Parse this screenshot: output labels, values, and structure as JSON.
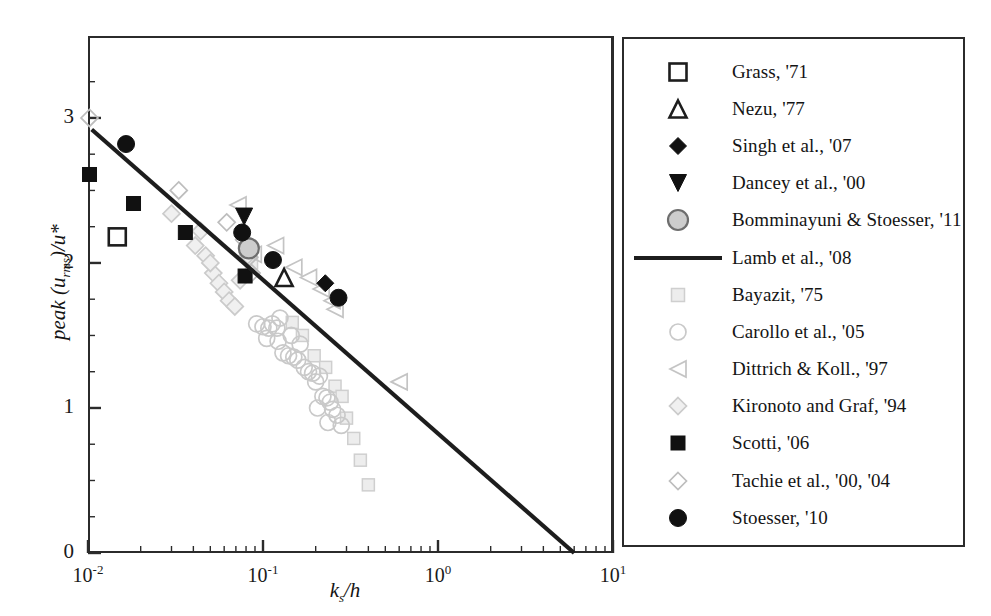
{
  "chart_data": {
    "type": "scatter",
    "title": "",
    "xlabel": "k_s/h",
    "xlabel_main": "k",
    "xlabel_sub": "s",
    "xlabel_tail": "/h",
    "ylabel": "peak (u_rms)/u*",
    "ylabel_pre": "peak (u",
    "ylabel_sub": "rms",
    "ylabel_post": ")/u*",
    "xscale": "log",
    "yscale": "linear",
    "xlim": [
      0.01,
      10
    ],
    "ylim": [
      0,
      3.4
    ],
    "grid": false,
    "legend_position": "right-outside",
    "xticks": [
      {
        "value": 0.01,
        "label_base": "10",
        "label_exp": "-2"
      },
      {
        "value": 0.1,
        "label_base": "10",
        "label_exp": "-1"
      },
      {
        "value": 1,
        "label_base": "10",
        "label_exp": "0"
      },
      {
        "value": 10,
        "label_base": "10",
        "label_exp": "1"
      }
    ],
    "yticks": [
      {
        "value": 0,
        "label": "0"
      },
      {
        "value": 1,
        "label": "1"
      },
      {
        "value": 2,
        "label": "2"
      },
      {
        "value": 3,
        "label": "3"
      }
    ],
    "fit_line": {
      "name": "Lamb et al., '08",
      "x_start": 0.0105,
      "y_start": 2.92,
      "x_end": 6.0,
      "y_end": 0.0,
      "color": "#1d1d1d",
      "width": 4.2
    },
    "series": [
      {
        "name": "Grass, '71",
        "marker": "square-open",
        "color": "#1d1d1d",
        "size": 17,
        "points": [
          [
            0.0147,
            2.18
          ]
        ]
      },
      {
        "name": "Nezu, '77",
        "marker": "triangle-up-open",
        "color": "#1d1d1d",
        "size": 17,
        "points": [
          [
            0.132,
            1.9
          ]
        ]
      },
      {
        "name": "Singh et al., '07",
        "marker": "diamond-filled",
        "color": "#111111",
        "size": 17,
        "points": [
          [
            0.227,
            1.86
          ]
        ]
      },
      {
        "name": "Dancey et al., '00",
        "marker": "triangle-down-filled",
        "color": "#111111",
        "size": 17,
        "points": [
          [
            0.078,
            2.32
          ]
        ]
      },
      {
        "name": "Bomminayuni & Stoesser, '11",
        "marker": "circle-grey",
        "color": "#9c9c9c",
        "size": 20,
        "points": [
          [
            0.083,
            2.1
          ]
        ]
      },
      {
        "name": "Bayazit, '75",
        "marker": "square-light",
        "color": "#cfcfcf",
        "size": 12,
        "points": [
          [
            0.086,
            2.0
          ],
          [
            0.147,
            1.59
          ],
          [
            0.168,
            1.5
          ],
          [
            0.196,
            1.36
          ],
          [
            0.228,
            1.28
          ],
          [
            0.258,
            1.15
          ],
          [
            0.283,
            1.08
          ],
          [
            0.3,
            0.93
          ],
          [
            0.33,
            0.79
          ],
          [
            0.36,
            0.64
          ],
          [
            0.4,
            0.47
          ]
        ]
      },
      {
        "name": "Carollo et al., '05",
        "marker": "circle-light",
        "color": "#c9c9c9",
        "size": 16,
        "points": [
          [
            0.092,
            1.58
          ],
          [
            0.1,
            1.56
          ],
          [
            0.108,
            1.55
          ],
          [
            0.113,
            1.58
          ],
          [
            0.12,
            1.55
          ],
          [
            0.122,
            1.46
          ],
          [
            0.13,
            1.38
          ],
          [
            0.14,
            1.36
          ],
          [
            0.15,
            1.35
          ],
          [
            0.158,
            1.33
          ],
          [
            0.145,
            1.5
          ],
          [
            0.163,
            1.44
          ],
          [
            0.172,
            1.28
          ],
          [
            0.182,
            1.25
          ],
          [
            0.192,
            1.24
          ],
          [
            0.2,
            1.18
          ],
          [
            0.21,
            1.22
          ],
          [
            0.22,
            1.08
          ],
          [
            0.232,
            1.07
          ],
          [
            0.242,
            1.04
          ],
          [
            0.25,
            0.99
          ],
          [
            0.265,
            0.95
          ],
          [
            0.28,
            0.88
          ],
          [
            0.125,
            1.62
          ],
          [
            0.105,
            1.48
          ],
          [
            0.205,
            1.0
          ],
          [
            0.235,
            0.9
          ]
        ]
      },
      {
        "name": "Dittrich & Koll., '97",
        "marker": "triangle-left-light",
        "color": "#c4c4c4",
        "size": 16,
        "points": [
          [
            0.072,
            2.4
          ],
          [
            0.118,
            2.12
          ],
          [
            0.15,
            1.97
          ],
          [
            0.182,
            1.9
          ],
          [
            0.215,
            1.82
          ],
          [
            0.248,
            1.74
          ],
          [
            0.258,
            1.68
          ],
          [
            0.6,
            1.18
          ],
          [
            0.088,
            2.06
          ]
        ]
      },
      {
        "name": "Kironoto and Graf, '94",
        "marker": "diamond-light",
        "color": "#cbcbcb",
        "size": 17,
        "points": [
          [
            0.03,
            2.34
          ],
          [
            0.041,
            2.12
          ],
          [
            0.047,
            2.05
          ],
          [
            0.052,
            1.93
          ],
          [
            0.056,
            1.86
          ],
          [
            0.06,
            1.8
          ],
          [
            0.064,
            1.74
          ],
          [
            0.069,
            1.7
          ],
          [
            0.074,
            1.88
          ],
          [
            0.08,
            2.04
          ],
          [
            0.05,
            2.0
          ],
          [
            0.044,
            2.22
          ]
        ]
      },
      {
        "name": "Scotti, '06",
        "marker": "square-filled",
        "color": "#111111",
        "size": 14,
        "points": [
          [
            0.0102,
            2.61
          ],
          [
            0.0182,
            2.41
          ],
          [
            0.036,
            2.21
          ],
          [
            0.079,
            1.91
          ]
        ]
      },
      {
        "name": "Tachie et al., '00, '04",
        "marker": "diamond-open-light",
        "color": "#bdbdbd",
        "size": 17,
        "points": [
          [
            0.0102,
            3.0
          ],
          [
            0.062,
            2.28
          ],
          [
            0.033,
            2.5
          ],
          [
            0.078,
            2.16
          ],
          [
            0.0835,
            2.04
          ],
          [
            0.086,
            1.93
          ]
        ]
      },
      {
        "name": "Stoesser, '10",
        "marker": "circle-filled",
        "color": "#111111",
        "size": 17,
        "points": [
          [
            0.0165,
            2.82
          ],
          [
            0.076,
            2.21
          ],
          [
            0.114,
            2.02
          ],
          [
            0.27,
            1.76
          ]
        ]
      }
    ]
  },
  "legend": {
    "entries": [
      {
        "label": "Grass, '71",
        "marker": "square-open"
      },
      {
        "label": "Nezu, '77",
        "marker": "triangle-up-open"
      },
      {
        "label": "Singh et al., '07",
        "marker": "diamond-filled"
      },
      {
        "label": "Dancey et al., '00",
        "marker": "triangle-down-filled"
      },
      {
        "label": "Bomminayuni & Stoesser, '11",
        "marker": "circle-grey"
      },
      {
        "label": "Lamb et al., '08",
        "marker": "line"
      },
      {
        "label": "Bayazit, '75",
        "marker": "square-light"
      },
      {
        "label": "Carollo et al., '05",
        "marker": "circle-light"
      },
      {
        "label": "Dittrich & Koll., '97",
        "marker": "triangle-left-light"
      },
      {
        "label": "Kironoto and Graf, '94",
        "marker": "diamond-light"
      },
      {
        "label": "Scotti, '06",
        "marker": "square-filled"
      },
      {
        "label": "Tachie et al., '00, '04",
        "marker": "diamond-open-light"
      },
      {
        "label": "Stoesser, '10",
        "marker": "circle-filled"
      }
    ]
  }
}
